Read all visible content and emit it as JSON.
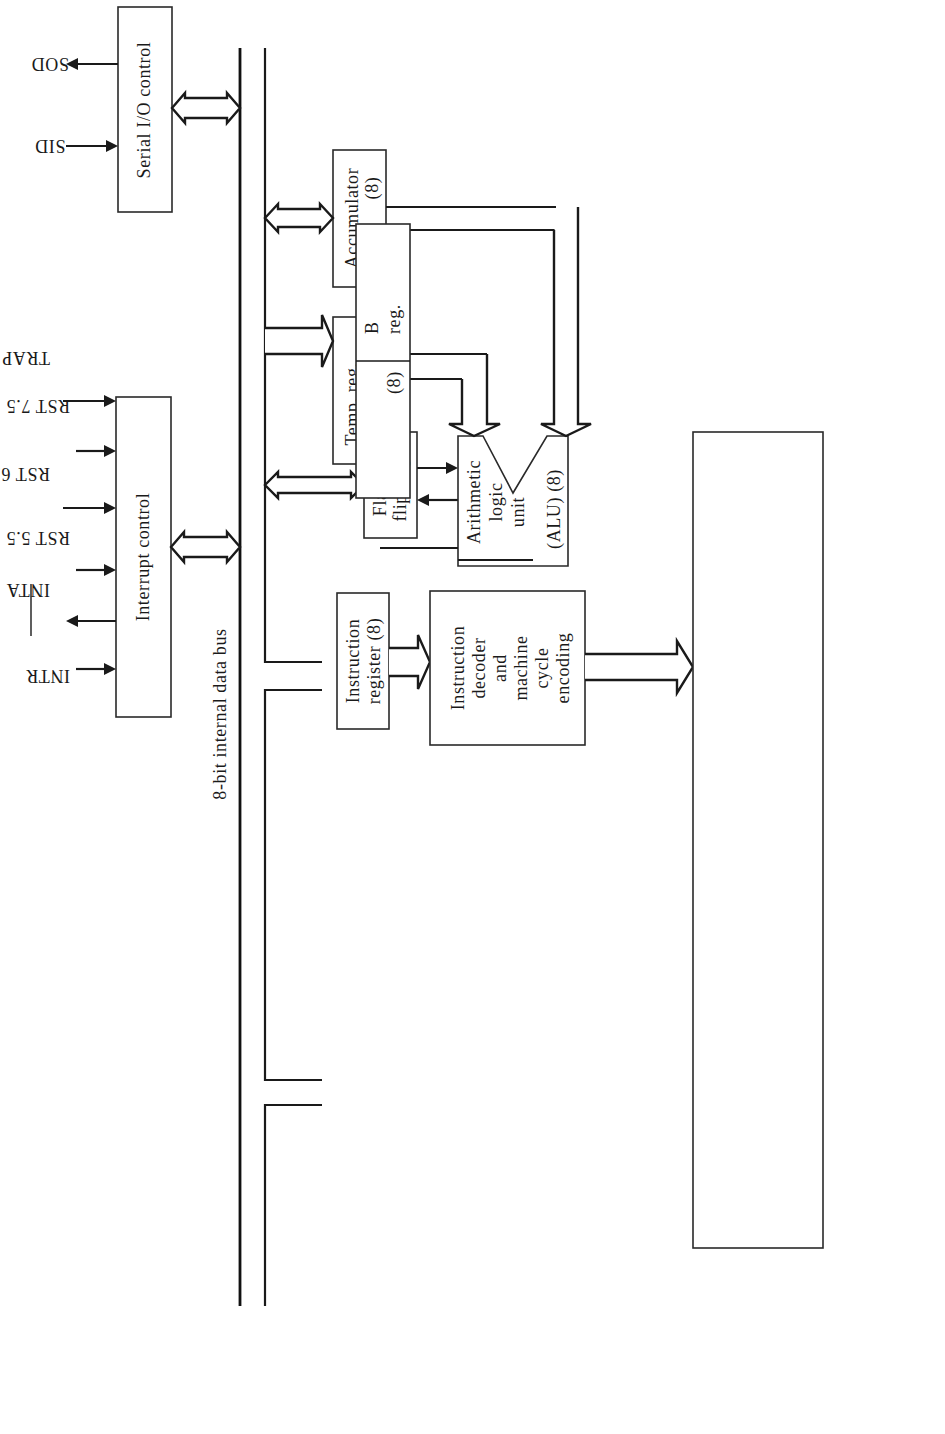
{
  "diagram": {
    "bus_label": "8-bit internal data bus",
    "blocks": {
      "serial_io": "Serial I/O control",
      "interrupt": "Interrupt control",
      "accumulator": [
        "Accumulator",
        "(8)"
      ],
      "temp_reg": [
        "Temp. reg.",
        "(8)"
      ],
      "flag": [
        "Flag (5)",
        "flip-flops"
      ],
      "alu": [
        "Arithmetic",
        "logic",
        "unit",
        "(ALU) (8)"
      ],
      "instruction_register": [
        "Instruction",
        "register (8)"
      ],
      "decoder": [
        "Instruction",
        "decoder",
        "and",
        "machine",
        "cycle",
        "encoding"
      ],
      "timing": "Timing and control",
      "clk_gen": [
        "CLK",
        "GEN"
      ],
      "data_address_buffer": [
        "Data/address",
        "buffer (8)"
      ],
      "address_buffer": "Address buffer (8)"
    },
    "register_array": {
      "label": [
        "Register",
        "array"
      ],
      "pairs": [
        {
          "left": "B",
          "left_sub": "reg.",
          "left_size": "(8)",
          "right": "C",
          "right_sub": "reg.",
          "right_size": "(8)"
        },
        {
          "left": "D",
          "left_sub": "reg.",
          "left_size": "(8)",
          "right": "E",
          "right_sub": "reg.",
          "right_size": "(8)"
        },
        {
          "left": "H",
          "left_sub": "reg.",
          "left_size": "(8)",
          "right": "L",
          "right_sub": "reg.",
          "right_size": "(8)"
        }
      ],
      "stack_pointer": "Stack pointer",
      "stack_pointer_size": "(16)",
      "program_counter": "Program counter",
      "program_counter_size": "(16)",
      "inc_dec": [
        "Incrementer/decrementer",
        "address latch"
      ],
      "inc_dec_size": "(16)"
    },
    "signals": {
      "sid": "SID",
      "sod": "SOD",
      "intr": "INTR",
      "inta": "INTA",
      "rst55": "RST 5.5",
      "rst65": "RST 6.5",
      "rst75": "RST 7.5",
      "trap": "TRAP",
      "power": [
        "+5 V",
        "GND"
      ],
      "power_label": [
        "Power",
        "supply"
      ],
      "x1": "X",
      "x1_sub": "1",
      "x2": "X",
      "x2_sub": "2",
      "clk_out": "CLK OUT",
      "ready": "READY",
      "rd": "RD",
      "wr": "WR",
      "ale": "ALE",
      "s0": "S",
      "s0_sub": "0",
      "s1": "S",
      "s1_sub": "1",
      "iom": "IO/",
      "iom_bar": "M",
      "hold": "HOLD",
      "hlda": "HLDA",
      "reset_in": "RESET IN",
      "reset_out": "RESET OUT",
      "group_control": "CONTROL",
      "group_status": "STATUS",
      "group_dma": "DMA",
      "group_reset": "RESET",
      "addr_bus_hi": [
        "A",
        "15",
        "–A",
        "8"
      ],
      "addr_bus_hi_label": "address bus",
      "ad_bus": [
        "AD",
        "7",
        "–AD",
        "0"
      ],
      "ad_bus_label": "address data bus"
    }
  }
}
